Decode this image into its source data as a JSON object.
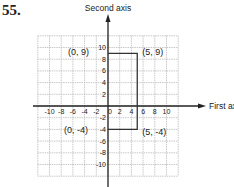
{
  "problem_number": "55.",
  "axes": {
    "x_label": "First axis",
    "y_label": "Second axis",
    "x_ticks": [
      "-10",
      "-8",
      "-6",
      "-4",
      "-2",
      "0",
      "2",
      "4",
      "6",
      "8",
      "10"
    ],
    "y_ticks": [
      "10",
      "8",
      "6",
      "4",
      "2",
      "-2",
      "-4",
      "-6",
      "-8",
      "-10"
    ],
    "range": [
      -12,
      12
    ]
  },
  "points": [
    {
      "label": "(0, 9)",
      "x": 0,
      "y": 9
    },
    {
      "label": "(5, 9)",
      "x": 5,
      "y": 9
    },
    {
      "label": "(0, -4)",
      "x": 0,
      "y": -4
    },
    {
      "label": "(5, -4)",
      "x": 5,
      "y": -4
    }
  ],
  "colors": {
    "line": "#333333",
    "grid": "#bbbbbb"
  }
}
